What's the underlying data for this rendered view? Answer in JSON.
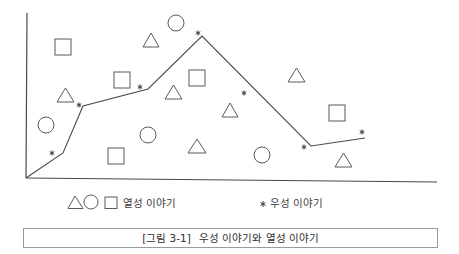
{
  "figure": {
    "caption": {
      "number": "[그림 3-1]",
      "title": "우성 이야기와 열성 이야기"
    },
    "legend": {
      "recessive": {
        "symbols": [
          "triangle",
          "circle",
          "square"
        ],
        "label": "열성 이야기"
      },
      "dominant": {
        "symbol": "asterisk",
        "label": "우성 이야기"
      }
    },
    "colors": {
      "background": "#ffffff",
      "axis": "#4a4a4a",
      "shape_stroke": "#5a5a5a",
      "caption_border": "#9a9a9a"
    },
    "axes": {
      "origin": [
        26,
        178
      ],
      "y_top": [
        27,
        13
      ],
      "x_end": [
        437,
        182
      ]
    },
    "dominant_story": {
      "line_points": [
        [
          26,
          178
        ],
        [
          63,
          153
        ],
        [
          83,
          106
        ],
        [
          148,
          89
        ],
        [
          202,
          36
        ],
        [
          311,
          146
        ],
        [
          365,
          138
        ]
      ],
      "markers": [
        [
          52,
          153
        ],
        [
          79,
          105
        ],
        [
          140,
          87
        ],
        [
          198,
          33
        ],
        [
          244,
          93
        ],
        [
          304,
          147
        ],
        [
          362,
          132
        ]
      ]
    },
    "recessive_stories": {
      "squares": [
        [
          55,
          39,
          16
        ],
        [
          114,
          72,
          16
        ],
        [
          189,
          70,
          16
        ],
        [
          108,
          148,
          16
        ],
        [
          329,
          105,
          16
        ]
      ],
      "circles": [
        [
          176,
          23,
          8
        ],
        [
          46,
          125,
          8
        ],
        [
          148,
          135,
          8
        ],
        [
          262,
          155,
          8
        ]
      ],
      "triangles": [
        [
          143,
          33,
          159,
          47
        ],
        [
          57,
          88,
          74,
          102
        ],
        [
          165,
          85,
          182,
          99
        ],
        [
          222,
          103,
          238,
          117
        ],
        [
          288,
          68,
          305,
          82
        ],
        [
          188,
          139,
          206,
          153
        ],
        [
          335,
          153,
          352,
          167
        ]
      ]
    }
  }
}
